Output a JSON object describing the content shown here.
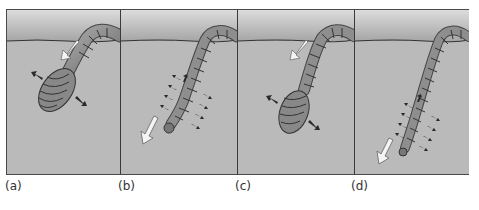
{
  "figure": {
    "colors": {
      "sky_top": "#d8d8d8",
      "sky_bottom": "#a9a9a9",
      "soil": "#b9b9b9",
      "surface_line": "#3a3a3a",
      "worm_fill": "#8e8e8e",
      "worm_segment": "#3c3c3c",
      "white_arrow": "#f4f4f4",
      "dark_arrow": "#2a2a2a"
    },
    "panels": [
      {
        "id": "a",
        "label": "(a)",
        "state": "anterior swollen, anchoring"
      },
      {
        "id": "b",
        "label": "(b)",
        "state": "anterior elongated, probing"
      },
      {
        "id": "c",
        "label": "(c)",
        "state": "anterior swollen, anchoring"
      },
      {
        "id": "d",
        "label": "(d)",
        "state": "anterior elongated, probing deeper"
      }
    ]
  }
}
